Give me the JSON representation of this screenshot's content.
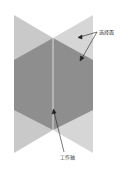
{
  "diagram": {
    "labels": {
      "selection_face": "选择面",
      "work_axis": "工作轴"
    },
    "colors": {
      "light_face": "#cfcfcf",
      "lighter_face": "#dcdcdc",
      "dark_face": "#8e8e8e",
      "axis_line": "#f2f2f2",
      "arrow": "#222222"
    }
  }
}
